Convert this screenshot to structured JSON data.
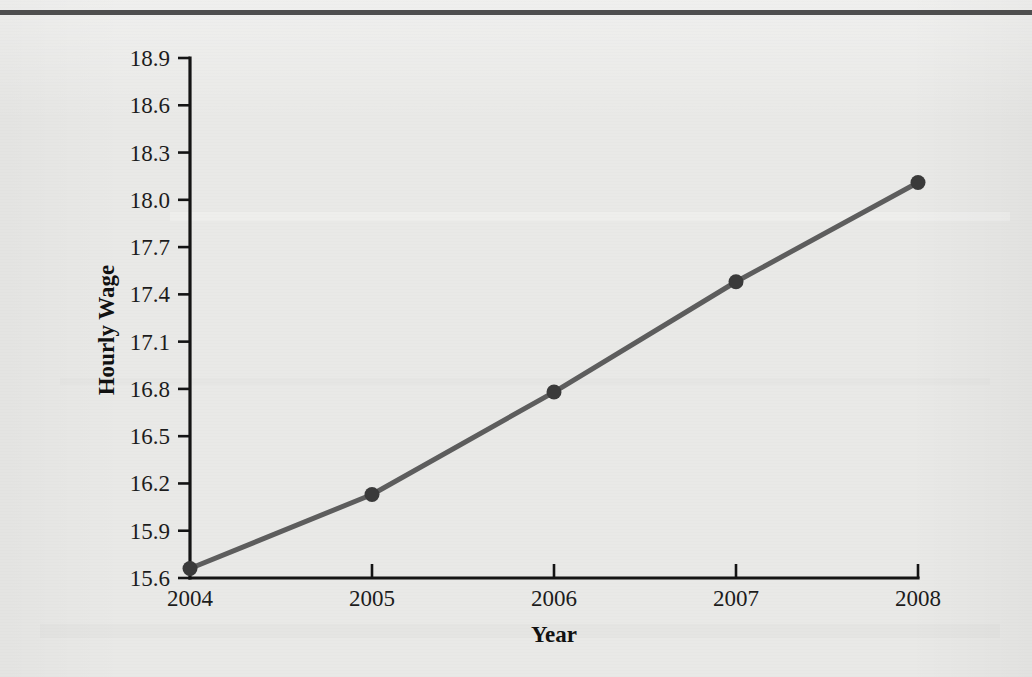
{
  "page": {
    "background_color": "#e9e9e7",
    "top_rule_color": "#4e4e4e"
  },
  "chart_data": {
    "type": "line",
    "title": "",
    "xlabel": "Year",
    "ylabel": "Hourly Wage",
    "categories": [
      "2004",
      "2005",
      "2006",
      "2007",
      "2008"
    ],
    "x": [
      2004,
      2005,
      2006,
      2007,
      2008
    ],
    "values": [
      15.66,
      16.13,
      16.78,
      17.48,
      18.11
    ],
    "series": [
      {
        "name": "Hourly Wage",
        "values": [
          15.66,
          16.13,
          16.78,
          17.48,
          18.11
        ]
      }
    ],
    "xlim": [
      2004,
      2008
    ],
    "ylim": [
      15.6,
      18.9
    ],
    "ytick_labels": [
      "15.6",
      "15.9",
      "16.2",
      "16.5",
      "16.8",
      "17.1",
      "17.4",
      "17.7",
      "18.0",
      "18.3",
      "18.6",
      "18.9"
    ],
    "ytick_values": [
      15.6,
      15.9,
      16.2,
      16.5,
      16.8,
      17.1,
      17.4,
      17.7,
      18.0,
      18.3,
      18.6,
      18.9
    ],
    "xtick_labels": [
      "2004",
      "2005",
      "2006",
      "2007",
      "2008"
    ],
    "grid": false,
    "legend": false,
    "legend_position": "none",
    "line_color": "#5d5d5d",
    "marker_color": "#3a3a3a",
    "marker_shape": "circle",
    "axis_color": "#141414"
  },
  "axes": {
    "y_title": "Hourly Wage",
    "x_title": "Year"
  }
}
